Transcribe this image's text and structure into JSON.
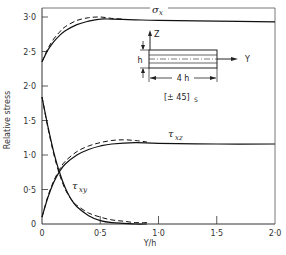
{
  "chart_data": {
    "type": "line",
    "title": "",
    "xlabel": "Y/h",
    "ylabel": "Relative stress",
    "xlim": [
      0,
      2.0
    ],
    "ylim": [
      0,
      3.0
    ],
    "x_ticks": [
      "0",
      "0·5",
      "1·0",
      "1·5",
      "2·0"
    ],
    "x_tick_values": [
      0,
      0.5,
      1.0,
      1.5,
      2.0
    ],
    "y_ticks": [
      "0",
      "0·5",
      "1·0",
      "1·5",
      "2·0",
      "2·5",
      "3·0"
    ],
    "y_tick_values": [
      0,
      0.5,
      1.0,
      1.5,
      2.0,
      2.5,
      3.0
    ],
    "grid": false,
    "series": [
      {
        "name": "σx",
        "label": "σ",
        "label_sub": "x",
        "style": "solid",
        "x": [
          0,
          0.05,
          0.1,
          0.15,
          0.2,
          0.3,
          0.4,
          0.5,
          0.6,
          0.8,
          1.0,
          1.5,
          2.0
        ],
        "y": [
          2.35,
          2.52,
          2.64,
          2.73,
          2.8,
          2.89,
          2.94,
          2.97,
          2.97,
          2.96,
          2.95,
          2.94,
          2.93
        ]
      },
      {
        "name": "σx (dashed)",
        "style": "dashed",
        "x": [
          0,
          0.05,
          0.1,
          0.15,
          0.2,
          0.3,
          0.4,
          0.5,
          0.6,
          0.7
        ],
        "y": [
          2.35,
          2.54,
          2.68,
          2.78,
          2.86,
          2.95,
          2.99,
          3.0,
          2.98,
          2.97
        ]
      },
      {
        "name": "τxz",
        "label": "τ",
        "label_sub": "xz",
        "style": "solid",
        "x": [
          0,
          0.05,
          0.1,
          0.15,
          0.2,
          0.3,
          0.4,
          0.5,
          0.6,
          0.8,
          1.0,
          1.5,
          2.0
        ],
        "y": [
          0.1,
          0.38,
          0.6,
          0.76,
          0.87,
          1.0,
          1.08,
          1.13,
          1.16,
          1.18,
          1.17,
          1.16,
          1.16
        ]
      },
      {
        "name": "τxz (dashed)",
        "style": "dashed",
        "x": [
          0,
          0.05,
          0.1,
          0.15,
          0.2,
          0.3,
          0.4,
          0.5,
          0.6,
          0.7,
          0.8,
          0.9
        ],
        "y": [
          0.1,
          0.4,
          0.62,
          0.79,
          0.91,
          1.05,
          1.13,
          1.18,
          1.21,
          1.22,
          1.21,
          1.19
        ]
      },
      {
        "name": "τxy",
        "label": "τ",
        "label_sub": "xy",
        "style": "solid",
        "x": [
          0,
          0.05,
          0.1,
          0.15,
          0.2,
          0.25,
          0.3,
          0.4,
          0.5,
          0.6,
          0.7,
          0.8,
          0.9
        ],
        "y": [
          1.84,
          1.42,
          1.05,
          0.75,
          0.52,
          0.36,
          0.25,
          0.12,
          0.05,
          0.02,
          0.01,
          0.0,
          0.0
        ]
      },
      {
        "name": "τxy (dashed)",
        "style": "dashed",
        "x": [
          0,
          0.05,
          0.1,
          0.15,
          0.2,
          0.25,
          0.3,
          0.4,
          0.5,
          0.6,
          0.7,
          0.8,
          0.9
        ],
        "y": [
          1.84,
          1.4,
          1.02,
          0.72,
          0.5,
          0.36,
          0.27,
          0.16,
          0.1,
          0.06,
          0.04,
          0.02,
          0.02
        ]
      }
    ],
    "annotations": {
      "inset": {
        "z_label": "Z",
        "y_label": "Y",
        "thickness_label": "h",
        "width_label": "4 h",
        "layup": "[± 45]",
        "layup_sub": "S"
      }
    }
  }
}
